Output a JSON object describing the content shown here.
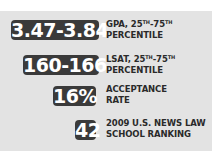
{
  "stats": [
    {
      "value": "3.47-3.84",
      "label_line1_prefix": "GPA, 25",
      "label_line1_sup1": "TH",
      "label_line1_mid": "-75",
      "label_line1_sup2": "TH",
      "label_line2": "PERCENTILE"
    },
    {
      "value": "160-166",
      "label_line1_prefix": "LSAT, 25",
      "label_line1_sup1": "TH",
      "label_line1_mid": "-75",
      "label_line1_sup2": "TH",
      "label_line2": "PERCENTILE"
    },
    {
      "value": "16%",
      "label_line1": "ACCEPTANCE",
      "label_line2": "RATE"
    },
    {
      "value": "42",
      "label_line1": "2009 U.S. NEWS LAW",
      "label_line2": "SCHOOL RANKING"
    }
  ],
  "colors": {
    "panel_background": "#e3e3e3",
    "badge_background": "#3a3a3a",
    "badge_text": "#ffffff",
    "label_text": "#2a2a2a"
  }
}
